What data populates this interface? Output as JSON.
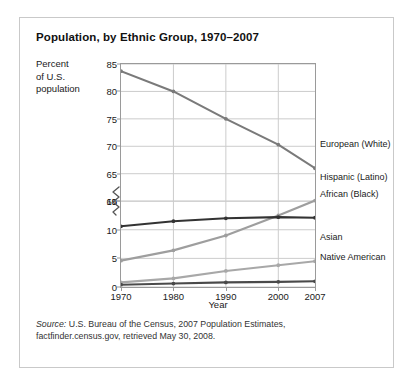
{
  "figure": {
    "title": "Population, by Ethnic Group, 1970–2007",
    "y_axis_caption_lines": [
      "Percent",
      "of U.S.",
      "population"
    ],
    "source_label": "Source:",
    "source_text": " U.S. Bureau of the Census, 2007 Population Estimates, factfinder.census.gov, retrieved May 30, 2008."
  },
  "chart_data": {
    "type": "line",
    "title": "Population, by Ethnic Group, 1970–2007",
    "xlabel": "Year",
    "ylabel": "Percent of U.S. population",
    "x": [
      1970,
      1980,
      1990,
      2000,
      2007
    ],
    "xtick_labels": [
      "1970",
      "1980",
      "1990",
      "2000",
      "2007"
    ],
    "grid": true,
    "legend_position": "right-of-plot (direct line labels)",
    "axis_break": {
      "present": true,
      "between": [
        15,
        60
      ],
      "symbol": "zigzag"
    },
    "upper_panel": {
      "ylim": [
        60,
        85
      ],
      "yticks": [
        60,
        65,
        70,
        75,
        80,
        85
      ],
      "ytick_labels": [
        "60",
        "65",
        "70",
        "75",
        "80",
        "85"
      ]
    },
    "lower_panel": {
      "ylim": [
        0,
        15
      ],
      "yticks": [
        0,
        5,
        10,
        15
      ],
      "ytick_labels": [
        "0",
        "5",
        "10",
        "15"
      ]
    },
    "series": [
      {
        "name": "European (White)",
        "color": "#7a7a7a",
        "panel": "upper",
        "values": [
          83.7,
          80.0,
          75.0,
          70.3,
          66.0
        ]
      },
      {
        "name": "Hispanic (Latino)",
        "color": "#9e9e9e",
        "panel": "lower",
        "values": [
          4.6,
          6.4,
          9.0,
          12.5,
          15.1
        ]
      },
      {
        "name": "African (Black)",
        "color": "#333333",
        "panel": "lower",
        "values": [
          10.6,
          11.5,
          12.0,
          12.2,
          12.1
        ]
      },
      {
        "name": "Asian",
        "color": "#a8a8a8",
        "panel": "lower",
        "values": [
          0.8,
          1.5,
          2.8,
          3.8,
          4.5
        ]
      },
      {
        "name": "Native American",
        "color": "#4a4a4a",
        "panel": "lower",
        "values": [
          0.4,
          0.6,
          0.8,
          0.9,
          1.0
        ]
      }
    ]
  }
}
